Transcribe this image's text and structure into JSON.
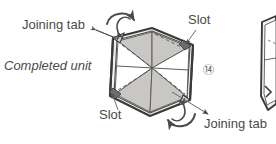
{
  "figure": {
    "step_number": "⑭",
    "step_number_value": 14,
    "labels": {
      "joining_tab_top": "Joining tab",
      "completed_unit": "Completed unit",
      "slot_top": "Slot",
      "slot_bottom": "Slot",
      "joining_tab_bottom": "Joining tab"
    },
    "colors": {
      "line": "#3a3a3a",
      "shade": "#c9c7c4",
      "paper": "#ffffff",
      "text": "#4a4a4a",
      "arrow": "#555555"
    },
    "annotations": {
      "rotation_arrow_top_left": "curved-rotation-arrow",
      "rotation_arrow_bottom_right": "curved-rotation-arrow",
      "leader_joining_tab_top": "arrow pointing up-left to upper tab",
      "leader_joining_tab_bottom": "arrow pointing down-right to lower tab",
      "leader_slot_top": "line pointing down-left to upper slot",
      "leader_slot_bottom": "line pointing up-right to lower slot"
    },
    "partial_next_figure": "partial unit visible at right edge"
  }
}
